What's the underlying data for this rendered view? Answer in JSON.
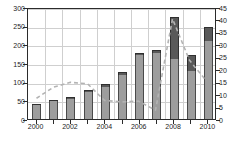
{
  "chart_data": {
    "type": "bar",
    "title": "",
    "subtitle": "",
    "xlabel": "",
    "ylabel": "",
    "y2label": "",
    "grid": true,
    "legend_position": "none",
    "categories": [
      "2000",
      "2001",
      "2002",
      "2003",
      "2004",
      "2005",
      "2006",
      "2007",
      "2008",
      "2009",
      "2010"
    ],
    "x_tick_labels": [
      "2000",
      "2002",
      "2004",
      "2006",
      "2008",
      "2010"
    ],
    "y_left": {
      "min": 0,
      "max": 300,
      "step": 50,
      "ticks": [
        "0",
        "50",
        "100",
        "150",
        "200",
        "250",
        "300"
      ]
    },
    "y_right": {
      "min": 0,
      "max": 45,
      "step": 5,
      "ticks": [
        "0",
        "5",
        "10",
        "15",
        "20",
        "25",
        "30",
        "35",
        "40",
        "45"
      ]
    },
    "series": [
      {
        "name": "lower-segment",
        "type": "bar-stack-bottom",
        "axis": "left",
        "color": "#9d9d9d",
        "values": [
          37,
          47,
          54,
          72,
          86,
          118,
          172,
          177,
          162,
          128,
          210
        ]
      },
      {
        "name": "upper-segment",
        "type": "bar-stack-top",
        "axis": "left",
        "color": "#595959",
        "values": [
          3,
          4,
          5,
          5,
          7,
          8,
          6,
          7,
          111,
          43,
          37
        ]
      },
      {
        "name": "bar-total",
        "type": "bar-total",
        "axis": "left",
        "values": [
          40,
          51,
          59,
          77,
          93,
          126,
          178,
          184,
          273,
          171,
          247
        ]
      },
      {
        "name": "dashed-line",
        "type": "line",
        "axis": "right",
        "color": "#b3b3b3",
        "style": "dashed",
        "values": [
          8.5,
          13.0,
          15.0,
          14.4,
          7.6,
          7.0,
          7.3,
          3.6,
          41.0,
          24.0,
          15.5
        ]
      }
    ]
  },
  "figure": {
    "background": "#ffffff",
    "axis_color": "#2b2b2b",
    "grid_color": "#cfcfcf",
    "tick_font_size_px": 7
  }
}
